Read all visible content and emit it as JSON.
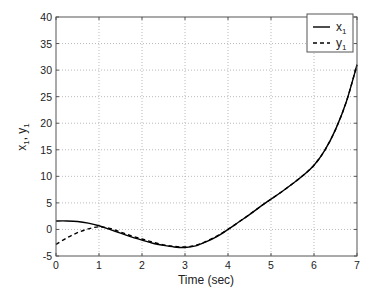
{
  "chart_data": {
    "type": "line",
    "title": "",
    "xlabel": "Time (sec)",
    "ylabel": "x1, y1",
    "xlim": [
      0,
      7
    ],
    "ylim": [
      -5,
      40
    ],
    "xticks": [
      0,
      1,
      2,
      3,
      4,
      5,
      6,
      7
    ],
    "yticks": [
      -5,
      0,
      5,
      10,
      15,
      20,
      25,
      30,
      35,
      40
    ],
    "grid": true,
    "legend_position": "upper right",
    "series": [
      {
        "name": "x1",
        "style": "solid",
        "color": "#000000",
        "x": [
          0,
          0.25,
          0.5,
          0.75,
          1,
          1.25,
          1.5,
          1.75,
          2,
          2.25,
          2.5,
          2.75,
          3,
          3.25,
          3.5,
          3.75,
          4,
          4.25,
          4.5,
          4.75,
          5,
          5.25,
          5.5,
          5.75,
          6,
          6.25,
          6.5,
          6.75,
          7
        ],
        "y": [
          1.6,
          1.6,
          1.5,
          1.2,
          0.7,
          0.0,
          -0.7,
          -1.4,
          -2.0,
          -2.6,
          -3.0,
          -3.3,
          -3.4,
          -3.1,
          -2.3,
          -1.3,
          0.0,
          1.4,
          2.8,
          4.3,
          5.7,
          7.1,
          8.6,
          10.2,
          12.1,
          14.9,
          18.8,
          24.0,
          31.0
        ]
      },
      {
        "name": "y1",
        "style": "dashed",
        "color": "#000000",
        "x": [
          0,
          0.25,
          0.5,
          0.75,
          1,
          1.25,
          1.5,
          1.75,
          2,
          2.25,
          2.5,
          2.75,
          3,
          3.25,
          3.5,
          3.75,
          4,
          4.25,
          4.5,
          4.75,
          5,
          5.25,
          5.5,
          5.75,
          6,
          6.25,
          6.5,
          6.75,
          7
        ],
        "y": [
          -2.8,
          -1.6,
          -0.6,
          0.1,
          0.5,
          0.2,
          -0.5,
          -1.2,
          -1.8,
          -2.4,
          -2.9,
          -3.2,
          -3.3,
          -3.0,
          -2.2,
          -1.2,
          0.0,
          1.4,
          2.8,
          4.3,
          5.7,
          7.1,
          8.6,
          10.2,
          12.1,
          14.9,
          18.8,
          24.0,
          31.0
        ]
      }
    ]
  },
  "legend": {
    "entries": [
      {
        "label": "x",
        "sub": "1"
      },
      {
        "label": "y",
        "sub": "1"
      }
    ]
  },
  "axes": {
    "xlabel": "Time (sec)",
    "ylabel_main": "x",
    "ylabel_sub1": "1",
    "ylabel_sep": ", ",
    "ylabel_main2": "y",
    "ylabel_sub2": "1"
  }
}
